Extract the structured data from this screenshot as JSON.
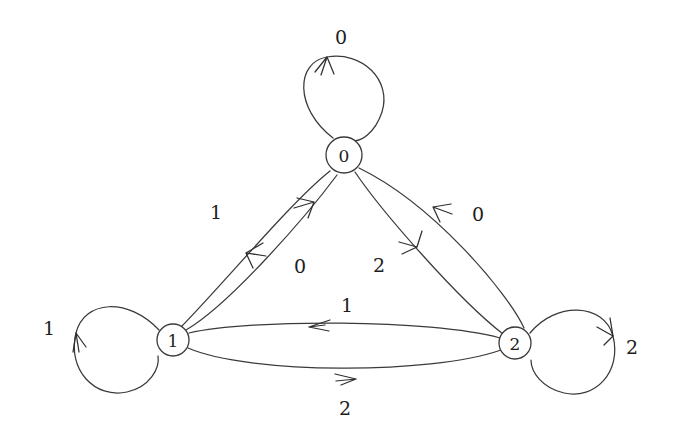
{
  "diagram": {
    "type": "state-transition-diagram",
    "title": "",
    "background_color": "#ffffff",
    "stroke_color": "#3a3a3a",
    "text_color": "#1d1d1d",
    "nodes": [
      {
        "id": "0",
        "label": "0",
        "cx": 344,
        "cy": 155,
        "r": 18
      },
      {
        "id": "1",
        "label": "1",
        "cx": 173,
        "cy": 340,
        "r": 16
      },
      {
        "id": "2",
        "label": "2",
        "cx": 515,
        "cy": 343,
        "r": 16
      }
    ],
    "self_loops": [
      {
        "node": "0",
        "label": "0",
        "label_x": 341,
        "label_y": 37,
        "position": "top",
        "path": "M 333 138 C 294 108 296 62 327 57 C 362 51 392 80 382 112 C 375 133 360 143 352 140",
        "arrow": "M 327 57 L 315 72 M 327 57 L 334 74 M 327 57 L 321 75"
      },
      {
        "node": "1",
        "label": "1",
        "label_x": 49,
        "label_y": 328,
        "position": "left",
        "path": "M 159 330 C 128 297 84 300 76 333 C 67 370 95 399 127 392 C 150 387 160 368 158 356",
        "arrow": "M 76 333 L 73 352 M 76 333 L 86 347 M 76 333 L 79 352"
      },
      {
        "node": "2",
        "label": "2",
        "label_x": 632,
        "label_y": 347,
        "position": "right",
        "path": "M 530 333 C 556 301 604 303 613 336 C 622 372 595 400 564 393 C 542 388 531 372 531 360",
        "arrow": "M 613 336 L 597 327 M 613 336 L 610 318 M 613 336 L 604 345"
      }
    ],
    "edges": [
      {
        "from": "0",
        "to": "1",
        "label": "1",
        "label_x": 216,
        "label_y": 212,
        "path": "M 330 171 C 292 201 225 282 181 327",
        "arrow": "M 246 253 L 266 256 M 246 253 L 263 243 M 246 253 L 253 268"
      },
      {
        "from": "1",
        "to": "0",
        "label": "0",
        "label_x": 300,
        "label_y": 266,
        "path": "M 186 330 C 229 305 305 218 337 175",
        "arrow": "M 314 202 L 294 208 M 314 202 L 297 198 M 314 202 L 308 218"
      },
      {
        "from": "2",
        "to": "0",
        "label": "0",
        "label_x": 478,
        "label_y": 214,
        "path": "M 524 328 C 508 293 433 204 359 168",
        "arrow": "M 433 207 L 452 214 M 433 207 L 451 204 M 433 207 L 440 222"
      },
      {
        "from": "0",
        "to": "2",
        "label": "2",
        "label_x": 379,
        "label_y": 265,
        "path": "M 355 172 C 382 212 459 300 503 334",
        "arrow": "M 417 247 L 399 242 M 417 247 L 402 254 M 417 247 L 422 231"
      },
      {
        "from": "2",
        "to": "1",
        "label": "1",
        "label_x": 347,
        "label_y": 305,
        "path": "M 500 338 C 430 319 250 319 189 333",
        "arrow": "M 309 327 L 330 320 M 309 327 L 329 331 M 309 327 L 325 325"
      },
      {
        "from": "1",
        "to": "2",
        "label": "2",
        "label_x": 345,
        "label_y": 408,
        "path": "M 188 348 C 248 374 430 375 501 350",
        "arrow": "M 356 379 L 335 374 M 356 379 L 336 381 M 356 379 L 341 385"
      }
    ],
    "alphabet": [
      "0",
      "1",
      "2"
    ],
    "transition_table": {
      "columns": [
        "state",
        "0",
        "1",
        "2"
      ],
      "rows": [
        {
          "state": "0",
          "0": "0",
          "1": "1",
          "2": "2"
        },
        {
          "state": "1",
          "0": "0",
          "1": "1",
          "2": "2"
        },
        {
          "state": "2",
          "0": "0",
          "1": "1",
          "2": "2"
        }
      ]
    }
  }
}
